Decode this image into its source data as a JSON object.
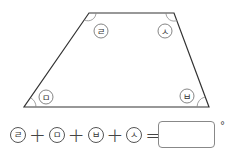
{
  "figure": {
    "shape": "trapezoid",
    "vertices": {
      "top_left": [
        89,
        13
      ],
      "top_right": [
        174,
        13
      ],
      "bottom_right": [
        209,
        107
      ],
      "bottom_left": [
        24,
        107
      ]
    },
    "angle_labels": {
      "top_left": "ㄹ",
      "top_right": "ㅅ",
      "bottom_right": "ㅂ",
      "bottom_left": "ㅁ"
    },
    "line_color": "#333333"
  },
  "equation": {
    "terms": [
      "ㄹ",
      "ㅁ",
      "ㅂ",
      "ㅅ"
    ],
    "plus": "+",
    "equals": "=",
    "answer_value": "",
    "unit": "°"
  }
}
